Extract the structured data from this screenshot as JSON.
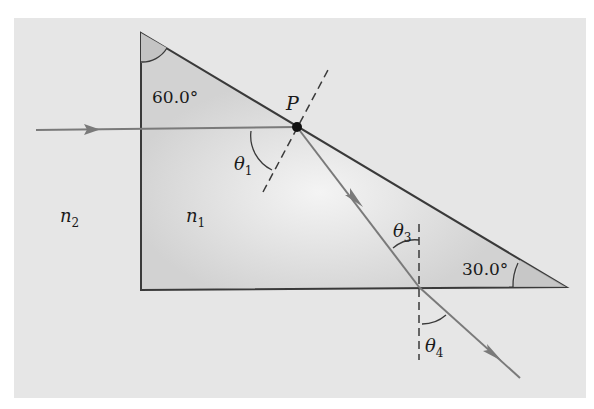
{
  "figure": {
    "colors": {
      "panel": "#e6e6e6",
      "prism_fill": "#d4d4d4",
      "prism_highlight": "#f2f2f2",
      "edge": "#3a3a3a",
      "ray": "#7a7a7a"
    },
    "angles": {
      "top_angle": "60.0°",
      "right_angle": "30.0°"
    },
    "labels": {
      "point": "P",
      "theta1": "θ",
      "theta1_sub": "1",
      "theta3": "θ",
      "theta3_sub": "3",
      "theta4": "θ",
      "theta4_sub": "4",
      "n1": "n",
      "n1_sub": "1",
      "n2": "n",
      "n2_sub": "2"
    }
  }
}
